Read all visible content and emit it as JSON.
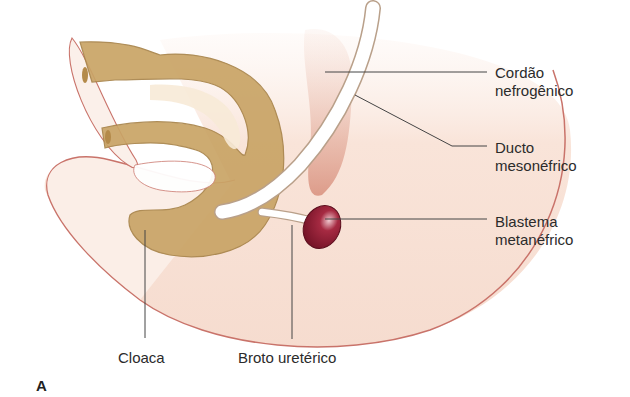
{
  "figure": {
    "panel_letter": "A",
    "labels": {
      "cordao": {
        "line1": "Cordão",
        "line2": "nefrogênico"
      },
      "ducto": {
        "line1": "Ducto",
        "line2": "mesonéfrico"
      },
      "blastema": {
        "line1": "Blastema",
        "line2": "metanéfrico"
      },
      "cloaca": "Cloaca",
      "broto": "Broto uretérico"
    },
    "colors": {
      "body_fill": "#f8e6dc",
      "body_outline": "#c9736a",
      "gut_fill": "#c9a466",
      "gut_outline": "#a8844a",
      "duct_fill": "#ffffff",
      "blastema_fill": "#8a1a2e",
      "nephrogenic_cord": "#dba08e",
      "leader_line": "#444444"
    }
  }
}
